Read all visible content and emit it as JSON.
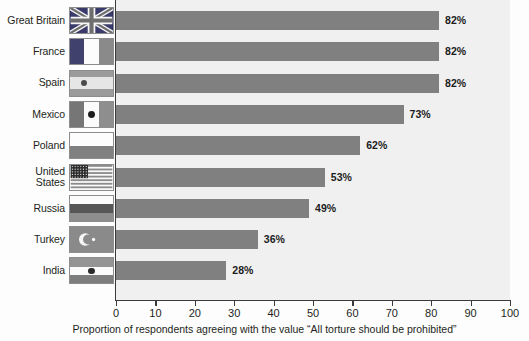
{
  "chart_data": {
    "type": "bar",
    "orientation": "horizontal",
    "title": "",
    "xlabel": "Proportion of respondents agreeing with the value “All torture should be prohibited”",
    "ylabel": "",
    "xlim": [
      0,
      100
    ],
    "xticks": [
      0,
      10,
      20,
      30,
      40,
      50,
      60,
      70,
      80,
      90,
      100
    ],
    "xtick_labels": [
      "0",
      "10",
      "20",
      "30",
      "40",
      "50",
      "60",
      "70",
      "80",
      "90",
      "100"
    ],
    "grid": false,
    "legend": "none",
    "bar_color": "#808080",
    "plot_background": "#f0f0f0",
    "categories": [
      "Great Britain",
      "France",
      "Spain",
      "Mexico",
      "Poland",
      "United States",
      "Russia",
      "Turkey",
      "India"
    ],
    "values": [
      82,
      82,
      82,
      73,
      62,
      53,
      49,
      36,
      28
    ],
    "value_labels": [
      "82%",
      "82%",
      "82%",
      "73%",
      "62%",
      "53%",
      "49%",
      "36%",
      "28%"
    ]
  },
  "rows": [
    {
      "country": "Great Britain",
      "label_lines": "Great Britain",
      "value": 82,
      "value_label": "82%",
      "flag": "flag-gb"
    },
    {
      "country": "France",
      "label_lines": "France",
      "value": 82,
      "value_label": "82%",
      "flag": "flag-fr"
    },
    {
      "country": "Spain",
      "label_lines": "Spain",
      "value": 82,
      "value_label": "82%",
      "flag": "flag-es"
    },
    {
      "country": "Mexico",
      "label_lines": "Mexico",
      "value": 73,
      "value_label": "73%",
      "flag": "flag-mx"
    },
    {
      "country": "Poland",
      "label_lines": "Poland",
      "value": 62,
      "value_label": "62%",
      "flag": "flag-pl"
    },
    {
      "country": "United States",
      "label_lines": "United\nStates",
      "value": 53,
      "value_label": "53%",
      "flag": "flag-us"
    },
    {
      "country": "Russia",
      "label_lines": "Russia",
      "value": 49,
      "value_label": "49%",
      "flag": "flag-ru"
    },
    {
      "country": "Turkey",
      "label_lines": "Turkey",
      "value": 36,
      "value_label": "36%",
      "flag": "flag-tr"
    },
    {
      "country": "India",
      "label_lines": "India",
      "value": 28,
      "value_label": "28%",
      "flag": "flag-in"
    }
  ],
  "axis": {
    "title": "Proportion of respondents agreeing with the value “All torture should be prohibited”",
    "ticks": [
      "0",
      "10",
      "20",
      "30",
      "40",
      "50",
      "60",
      "70",
      "80",
      "90",
      "100"
    ]
  },
  "colors": {
    "bar": "#808080",
    "plot_bg": "#f0f0f0",
    "axis": "#3b3b3b",
    "text": "#231f20"
  }
}
